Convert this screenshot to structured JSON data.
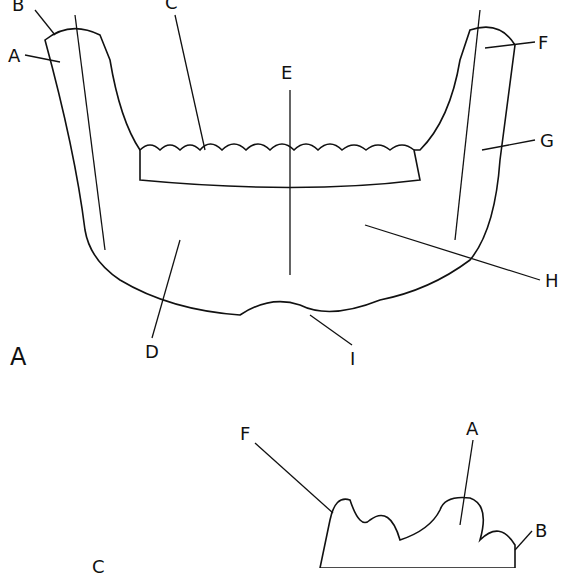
{
  "figure_top": {
    "panel_label": "A",
    "labels": {
      "A": "A",
      "B": "B",
      "C": "C",
      "D": "D",
      "E": "E",
      "F": "F",
      "G": "G",
      "H": "H",
      "I": "I"
    }
  },
  "figure_bottom": {
    "labels": {
      "F": "F",
      "A": "A",
      "B": "B",
      "C": "C"
    }
  }
}
